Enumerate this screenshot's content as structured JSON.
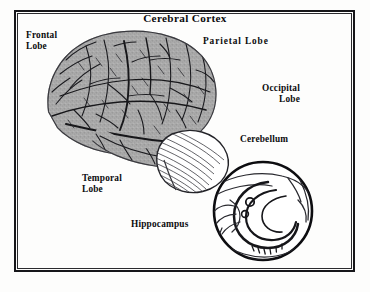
{
  "figure": {
    "title": "Cerebral Cortex",
    "background_color": "#fdfdfc",
    "frame_color": "#16161a"
  },
  "labels": {
    "frontal_lobe": "Frontal\nLobe",
    "parietal_lobe": "Parietal  Lobe",
    "occipital_lobe": "Occipital\nLobe",
    "cerebellum": "Cerebellum",
    "temporal_lobe": "Temporal\nLobe",
    "hippocampus": "Hippocampus"
  },
  "anatomy": {
    "cortex_fill": "#a9a9a9",
    "sulci_color": "#17171a",
    "cerebellum_fill": "#ffffff",
    "cerebellum_striation_color": "#3a3a3e",
    "inset_outline": "#0d0d10"
  }
}
